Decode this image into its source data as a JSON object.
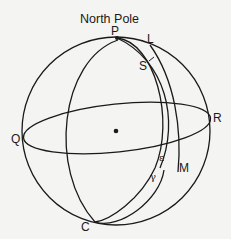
{
  "figure": {
    "title": "North Pole",
    "points": {
      "P": "P",
      "L": "L",
      "S": "S",
      "Q": "Q",
      "R": "R",
      "M": "M",
      "C": "C",
      "epsilon": "ε",
      "gamma": "γ"
    },
    "colors": {
      "ink": "#1a1a1a",
      "background": "#f4f4f2"
    }
  }
}
